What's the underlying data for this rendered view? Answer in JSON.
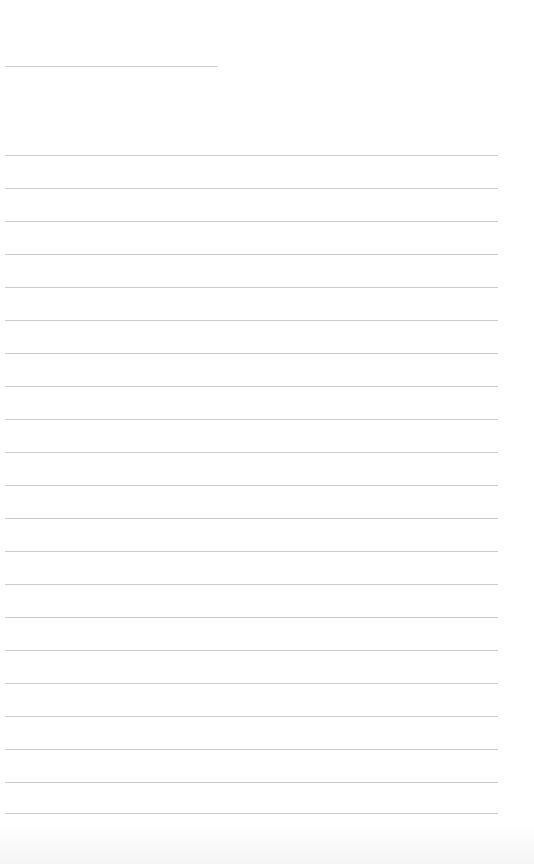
{
  "document": {
    "type": "blank ruled notebook page",
    "background_color": "#ffffff",
    "line_color": "#cbcbcb"
  },
  "header_line": {
    "x": 5,
    "y": 66,
    "width": 213
  },
  "ruled_lines": {
    "count": 21,
    "x": 5,
    "width": 493,
    "y_positions": [
      155,
      188,
      221,
      254,
      287,
      320,
      353,
      386,
      419,
      452,
      485,
      518,
      551,
      584,
      617,
      650,
      683,
      716,
      749,
      782,
      813
    ]
  }
}
